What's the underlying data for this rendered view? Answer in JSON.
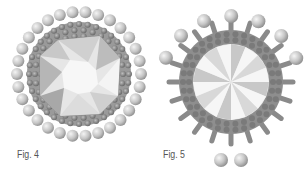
{
  "figures": [
    {
      "id": "fig4",
      "caption": "Fig. 4",
      "description": "Octagonal faceted crystal surrounded by beaded bezel with outer ring of pearls",
      "center": [
        79,
        74
      ],
      "colors": {
        "pearl": "#c8c8c8",
        "bead": "#8a8a8a",
        "crystal_light": "#f2f2f2",
        "crystal_dark": "#9a9a9a"
      }
    },
    {
      "id": "fig5",
      "caption": "Fig. 5",
      "description": "Round rivoli crystal in beaded bezel with spike picots, large pearls along top and two at bottom",
      "center": [
        231,
        82
      ],
      "colors": {
        "pearl": "#c8c8c8",
        "bead": "#8a8a8a",
        "crystal_light": "#f4f4f4",
        "crystal_dark": "#a0a0a0"
      }
    }
  ]
}
